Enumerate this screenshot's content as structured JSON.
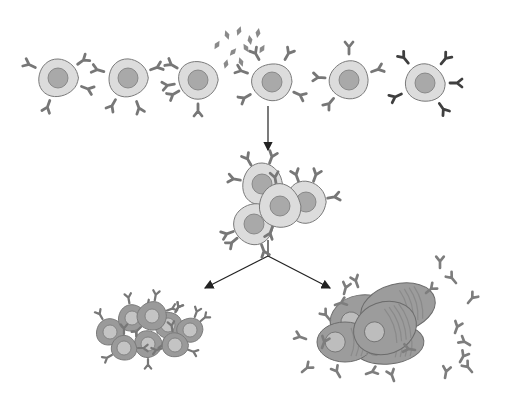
{
  "diagram": {
    "stages": [
      {
        "id": "resting",
        "description": "Resting B cells with surface receptors"
      },
      {
        "id": "antigen-binding",
        "description": "One B cell binds antigen particles"
      },
      {
        "id": "proliferation",
        "description": "Activated B cell proliferates into clone"
      },
      {
        "id": "memory",
        "description": "Memory B cells"
      },
      {
        "id": "plasma",
        "description": "Plasma cells secreting antibodies"
      }
    ],
    "row_cells": 6,
    "colors": {
      "cell_fill": "#dcdcdc",
      "cell_stroke": "#7a7a7a",
      "nucleus_fill": "#a9a9a9",
      "receptor": "#777777",
      "receptor_dark": "#3f3f3f",
      "antigen": "#8a8a8a",
      "memory_cell": "#9a9a9a",
      "memory_nucleus": "#c4c4c4",
      "plasma_cell": "#9c9c9c",
      "plasma_nucleus": "#bdbdbd",
      "antibody": "#7d7d7d",
      "arrow": "#222222"
    }
  }
}
